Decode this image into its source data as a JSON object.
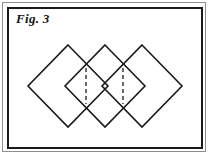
{
  "figure": {
    "label": "Fig. 3",
    "background_color": "#ffffff",
    "stroke_color": "#1a1a1a",
    "outer_frame_color": "#8e8e8e",
    "frame": {
      "outer": {
        "x": 2,
        "y": 2,
        "width": 204,
        "height": 150,
        "stroke_width": 1
      },
      "inner": {
        "x": 7,
        "y": 7,
        "width": 196,
        "height": 142,
        "stroke_width": 2
      }
    }
  },
  "chart_data": {
    "type": "diagram",
    "title": "Fig. 3",
    "shapes": [
      {
        "name": "diamond-left",
        "kind": "diamond",
        "center_x": 68,
        "center_y": 86,
        "half_width": 40,
        "half_height": 41,
        "stroke": "#1a1a1a",
        "stroke_width": 1.6,
        "fill": "none",
        "points": "68,45 108,86 68,127 28,86"
      },
      {
        "name": "diamond-middle",
        "kind": "diamond",
        "center_x": 105,
        "center_y": 86,
        "half_width": 40,
        "half_height": 41,
        "stroke": "#1a1a1a",
        "stroke_width": 1.6,
        "fill": "none",
        "points": "105,45 145,86 105,127 65,86"
      },
      {
        "name": "diamond-right",
        "kind": "diamond",
        "center_x": 142,
        "center_y": 86,
        "half_width": 40,
        "half_height": 41,
        "stroke": "#1a1a1a",
        "stroke_width": 1.6,
        "fill": "none",
        "points": "142,45 182,86 142,127 102,86"
      }
    ],
    "dashed_lines": [
      {
        "name": "dashed-chord-left",
        "x": 86,
        "y1": 68,
        "y2": 104,
        "stroke": "#2b2b2b",
        "stroke_width": 1.4,
        "dash_pattern": "4,3"
      },
      {
        "name": "dashed-chord-right",
        "x": 123,
        "y1": 68,
        "y2": 104,
        "stroke": "#2b2b2b",
        "stroke_width": 1.4,
        "dash_pattern": "4,3"
      }
    ]
  }
}
